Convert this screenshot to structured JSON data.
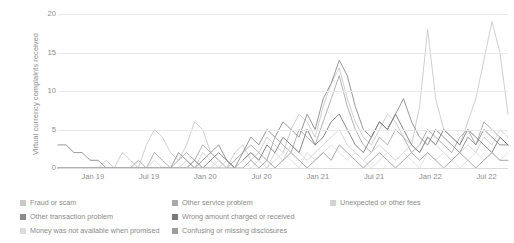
{
  "chart_data": {
    "type": "line",
    "title": "",
    "xlabel": "",
    "ylabel": "Virtual currency complaints received",
    "ylim": [
      0,
      20
    ],
    "yticks": [
      0,
      5,
      10,
      15,
      20
    ],
    "xticks": [
      "Jan 19",
      "Jul 19",
      "Jan 20",
      "Jul 20",
      "Jan 21",
      "Jul 21",
      "Jan 22",
      "Jul 22"
    ],
    "grid": true,
    "legend_position": "bottom",
    "x_start": "Jul 18",
    "x_end": "Nov 22",
    "x_interval": "monthly",
    "series": [
      {
        "name": "Fraud or scam",
        "color": "#c9c9c9",
        "values": [
          0,
          0,
          0,
          0,
          0,
          0,
          1,
          0,
          2,
          1,
          0,
          3,
          5,
          4,
          2,
          1,
          3,
          6,
          5,
          2,
          1,
          0,
          2,
          3,
          1,
          2,
          4,
          3,
          2,
          5,
          7,
          6,
          4,
          8,
          11,
          13,
          9,
          6,
          4,
          3,
          5,
          7,
          6,
          4,
          3,
          8,
          18,
          9,
          5,
          4,
          3,
          6,
          9,
          14,
          19,
          15,
          7
        ]
      },
      {
        "name": "Other service problem",
        "color": "#a8a8a8",
        "values": [
          0,
          0,
          0,
          0,
          0,
          0,
          0,
          0,
          0,
          0,
          1,
          0,
          2,
          1,
          0,
          1,
          2,
          1,
          3,
          2,
          1,
          0,
          1,
          2,
          3,
          2,
          1,
          4,
          3,
          2,
          5,
          4,
          3,
          6,
          9,
          12,
          8,
          5,
          3,
          2,
          4,
          3,
          5,
          4,
          2,
          3,
          5,
          4,
          3,
          2,
          4,
          5,
          3,
          6,
          5,
          4,
          3
        ]
      },
      {
        "name": "Unexpected or other fees",
        "color": "#d2d2d2",
        "values": [
          0,
          0,
          0,
          0,
          0,
          0,
          0,
          0,
          0,
          0,
          0,
          0,
          1,
          0,
          0,
          0,
          1,
          0,
          2,
          1,
          0,
          1,
          0,
          1,
          2,
          1,
          0,
          2,
          1,
          3,
          2,
          1,
          2,
          3,
          4,
          5,
          3,
          2,
          1,
          2,
          3,
          2,
          1,
          2,
          3,
          2,
          4,
          3,
          2,
          1,
          2,
          3,
          2,
          4,
          3,
          5,
          4
        ]
      },
      {
        "name": "Other transaction problem",
        "color": "#8c8c8c",
        "values": [
          3,
          3,
          2,
          2,
          1,
          1,
          0,
          0,
          0,
          0,
          0,
          0,
          0,
          0,
          0,
          2,
          1,
          0,
          1,
          2,
          3,
          1,
          0,
          2,
          4,
          3,
          5,
          4,
          6,
          5,
          4,
          7,
          5,
          9,
          11,
          14,
          12,
          8,
          5,
          4,
          6,
          5,
          7,
          9,
          6,
          4,
          3,
          5,
          4,
          3,
          2,
          4,
          3,
          5,
          4,
          3,
          3
        ]
      },
      {
        "name": "Wrong amount charged or received",
        "color": "#7a7a7a",
        "values": [
          0,
          0,
          0,
          0,
          0,
          0,
          0,
          0,
          0,
          0,
          0,
          0,
          0,
          0,
          0,
          0,
          0,
          1,
          0,
          1,
          2,
          1,
          0,
          1,
          2,
          1,
          3,
          2,
          4,
          3,
          2,
          5,
          3,
          4,
          6,
          7,
          5,
          3,
          2,
          4,
          6,
          5,
          7,
          5,
          3,
          2,
          4,
          3,
          5,
          4,
          3,
          5,
          4,
          3,
          2,
          4,
          3
        ]
      },
      {
        "name": "Money was not available when promised",
        "color": "#dcdcdc",
        "values": [
          0,
          0,
          0,
          0,
          0,
          0,
          0,
          0,
          0,
          0,
          0,
          0,
          0,
          0,
          0,
          0,
          0,
          0,
          0,
          0,
          1,
          0,
          0,
          1,
          0,
          1,
          0,
          1,
          2,
          1,
          0,
          2,
          1,
          2,
          3,
          2,
          1,
          2,
          1,
          0,
          1,
          2,
          1,
          2,
          1,
          0,
          2,
          1,
          2,
          1,
          0,
          1,
          2,
          1,
          2,
          1,
          2
        ]
      },
      {
        "name": "Confusing or missing disclosures",
        "color": "#9e9e9e",
        "values": [
          0,
          0,
          0,
          0,
          0,
          0,
          0,
          0,
          0,
          0,
          0,
          0,
          0,
          0,
          0,
          0,
          0,
          0,
          0,
          0,
          0,
          0,
          0,
          0,
          1,
          0,
          1,
          0,
          1,
          2,
          1,
          0,
          1,
          2,
          1,
          3,
          2,
          1,
          0,
          1,
          2,
          1,
          0,
          1,
          2,
          1,
          2,
          1,
          0,
          1,
          2,
          1,
          0,
          1,
          2,
          1,
          1
        ]
      }
    ]
  },
  "legend": {
    "columns": [
      [
        {
          "label": "Fraud or scam",
          "color": "#c9c9c9"
        },
        {
          "label": "Other transaction problem",
          "color": "#8c8c8c"
        },
        {
          "label": "Money was not available when promised",
          "color": "#dcdcdc"
        }
      ],
      [
        {
          "label": "Other service problem",
          "color": "#a8a8a8"
        },
        {
          "label": "Wrong amount charged or received",
          "color": "#7a7a7a"
        },
        {
          "label": "Confusing or missing disclosures",
          "color": "#9e9e9e"
        }
      ],
      [
        {
          "label": "Unexpected or other fees",
          "color": "#d2d2d2"
        }
      ]
    ]
  }
}
